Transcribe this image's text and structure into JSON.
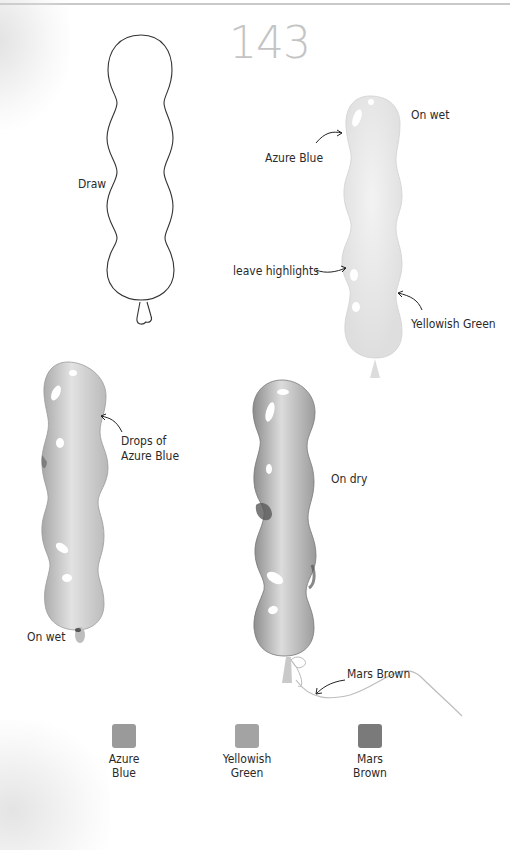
{
  "page": {
    "number": "143"
  },
  "steps": [
    {
      "id": "outline",
      "labels": [
        {
          "text": "Draw"
        }
      ]
    },
    {
      "id": "first-wash",
      "labels": [
        {
          "text": "On wet"
        },
        {
          "text": "Azure Blue"
        },
        {
          "text": "leave highlights"
        },
        {
          "text": "Yellowish Green"
        }
      ]
    },
    {
      "id": "second-wash",
      "labels": [
        {
          "text": "Drops of"
        },
        {
          "text": "Azure Blue"
        },
        {
          "text": "On wet"
        }
      ]
    },
    {
      "id": "final",
      "labels": [
        {
          "text": "On dry"
        },
        {
          "text": "Mars Brown"
        }
      ]
    }
  ],
  "palette": [
    {
      "name_line1": "Azure",
      "name_line2": "Blue",
      "color": "#9a9a9a"
    },
    {
      "name_line1": "Yellowish",
      "name_line2": "Green",
      "color": "#a3a3a3"
    },
    {
      "name_line1": "Mars",
      "name_line2": "Brown",
      "color": "#7a7a7a"
    }
  ]
}
